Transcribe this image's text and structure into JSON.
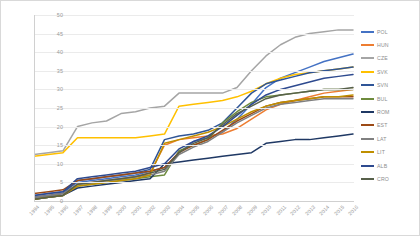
{
  "chart_data": {
    "type": "line",
    "title": "",
    "xlabel": "",
    "ylabel": "",
    "ylim": [
      0,
      50
    ],
    "yticks": [
      0,
      5,
      10,
      15,
      20,
      25,
      30,
      35,
      40,
      45,
      50
    ],
    "grid": true,
    "legend_position": "right",
    "x": [
      1994,
      1995,
      1996,
      1997,
      1998,
      1999,
      2000,
      2001,
      2002,
      2003,
      2004,
      2005,
      2006,
      2007,
      2008,
      2009,
      2010,
      2011,
      2012,
      2013,
      2014,
      2015,
      2016
    ],
    "series": [
      {
        "name": "POL",
        "color": "#4472c4",
        "values": [
          1.5,
          2.0,
          2.5,
          5.0,
          5.5,
          6.0,
          6.5,
          7.0,
          8.0,
          9.0,
          13.0,
          16.0,
          17.0,
          18.5,
          22.0,
          26.0,
          30.5,
          33.0,
          34.5,
          36.0,
          37.5,
          38.5,
          39.5
        ]
      },
      {
        "name": "HUN",
        "color": "#ed7d31",
        "values": [
          1.0,
          1.5,
          2.0,
          4.5,
          5.0,
          5.5,
          6.0,
          6.5,
          7.5,
          15.0,
          16.5,
          17.0,
          17.5,
          18.0,
          19.5,
          22.0,
          24.5,
          26.0,
          27.0,
          28.0,
          29.0,
          29.5,
          30.0
        ]
      },
      {
        "name": "CZE",
        "color": "#a5a5a5",
        "values": [
          12.5,
          13.0,
          13.5,
          20.0,
          21.0,
          21.5,
          23.5,
          24.0,
          25.0,
          25.5,
          29.0,
          29.0,
          29.0,
          29.0,
          30.5,
          35.0,
          39.0,
          42.0,
          44.0,
          45.0,
          45.5,
          46.0,
          46.0
        ]
      },
      {
        "name": "SVK",
        "color": "#ffc000",
        "values": [
          12.0,
          12.5,
          13.0,
          17.0,
          17.0,
          17.0,
          17.0,
          17.0,
          17.5,
          18.0,
          25.5,
          26.0,
          26.5,
          27.0,
          28.0,
          29.5,
          31.5,
          33.0,
          34.0,
          34.5,
          35.0,
          35.5,
          36.0
        ]
      },
      {
        "name": "SVN",
        "color": "#2f5597",
        "values": [
          1.0,
          1.5,
          2.0,
          5.5,
          6.0,
          6.5,
          7.0,
          7.5,
          8.5,
          16.5,
          17.5,
          18.0,
          19.0,
          21.0,
          25.0,
          29.0,
          31.5,
          32.5,
          33.5,
          34.5,
          35.0,
          35.5,
          36.0
        ]
      },
      {
        "name": "BUL",
        "color": "#6e8b3d",
        "values": [
          0.5,
          1.0,
          1.5,
          4.0,
          4.5,
          5.0,
          5.5,
          6.0,
          6.5,
          7.0,
          13.5,
          15.0,
          16.5,
          21.0,
          24.0,
          26.5,
          28.0,
          28.5,
          29.0,
          29.5,
          30.0,
          30.0,
          30.0
        ]
      },
      {
        "name": "ROM",
        "color": "#1f3864",
        "values": [
          0.5,
          1.0,
          1.5,
          3.5,
          4.0,
          4.5,
          5.0,
          5.5,
          6.0,
          10.0,
          10.5,
          11.0,
          11.5,
          12.0,
          12.5,
          13.0,
          15.5,
          16.0,
          16.5,
          16.5,
          17.0,
          17.5,
          18.0
        ]
      },
      {
        "name": "EST",
        "color": "#9c4a16"
      },
      {
        "name": "LAT",
        "color": "#808080"
      },
      {
        "name": "LIT",
        "color": "#bf8f00"
      },
      {
        "name": "ALB",
        "color": "#2e4a8f"
      },
      {
        "name": "CRO",
        "color": "#57604a"
      }
    ],
    "series_extra": [
      {
        "name": "EST",
        "color": "#9c4a16",
        "values": [
          2.0,
          2.5,
          3.0,
          5.5,
          6.0,
          6.5,
          7.0,
          7.5,
          8.0,
          9.0,
          13.0,
          15.0,
          16.5,
          19.0,
          21.5,
          23.5,
          25.5,
          26.5,
          27.0,
          27.5,
          28.0,
          28.0,
          28.0
        ]
      },
      {
        "name": "LAT",
        "color": "#808080",
        "values": [
          1.0,
          1.5,
          2.0,
          4.5,
          5.0,
          5.5,
          6.0,
          6.5,
          7.0,
          8.0,
          12.5,
          14.5,
          16.0,
          18.5,
          21.0,
          23.0,
          25.0,
          26.0,
          26.5,
          27.0,
          27.5,
          27.5,
          27.5
        ]
      },
      {
        "name": "LIT",
        "color": "#bf8f00",
        "values": [
          0.5,
          1.0,
          1.5,
          4.0,
          4.5,
          5.0,
          5.5,
          6.0,
          7.0,
          15.5,
          16.5,
          17.5,
          18.5,
          20.0,
          22.0,
          24.0,
          25.5,
          26.5,
          27.0,
          27.5,
          28.0,
          28.0,
          28.5
        ]
      },
      {
        "name": "ALB",
        "color": "#2e4a8f",
        "values": [
          1.5,
          2.0,
          2.5,
          6.0,
          6.5,
          7.0,
          7.5,
          8.0,
          9.0,
          10.0,
          14.0,
          16.0,
          17.5,
          20.0,
          23.0,
          26.0,
          28.5,
          30.0,
          31.0,
          32.0,
          33.0,
          33.5,
          34.0
        ]
      },
      {
        "name": "CRO",
        "color": "#57604a",
        "values": [
          0.5,
          1.0,
          1.5,
          4.5,
          5.0,
          5.5,
          6.0,
          6.5,
          7.5,
          8.5,
          13.0,
          15.5,
          17.0,
          20.5,
          23.5,
          25.5,
          27.5,
          28.5,
          29.0,
          29.5,
          30.0,
          30.0,
          30.5
        ]
      }
    ]
  },
  "legend": {
    "items": [
      {
        "label": "POL",
        "color": "#4472c4"
      },
      {
        "label": "HUN",
        "color": "#ed7d31"
      },
      {
        "label": "CZE",
        "color": "#a5a5a5"
      },
      {
        "label": "SVK",
        "color": "#ffc000"
      },
      {
        "label": "SVN",
        "color": "#2f5597"
      },
      {
        "label": "BUL",
        "color": "#6e8b3d"
      },
      {
        "label": "ROM",
        "color": "#1f3864"
      },
      {
        "label": "EST",
        "color": "#9c4a16"
      },
      {
        "label": "LAT",
        "color": "#808080"
      },
      {
        "label": "LIT",
        "color": "#bf8f00"
      },
      {
        "label": "ALB",
        "color": "#2e4a8f"
      },
      {
        "label": "CRO",
        "color": "#57604a"
      }
    ]
  }
}
